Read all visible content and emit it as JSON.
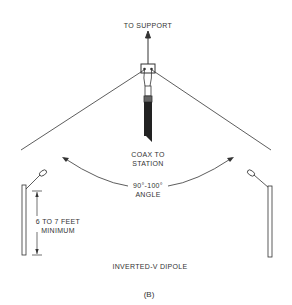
{
  "diagram": {
    "title": "INVERTED-V DIPOLE",
    "caption": "(B)",
    "labels": {
      "support": "TO SUPPORT",
      "coax_line1": "COAX TO",
      "coax_line2": "STATION",
      "angle_line1": "90°-100°",
      "angle_line2": "ANGLE",
      "height_line1": "6 TO 7 FEET",
      "height_line2": "MINIMUM"
    },
    "colors": {
      "line": "#333333",
      "background": "#ffffff"
    }
  }
}
